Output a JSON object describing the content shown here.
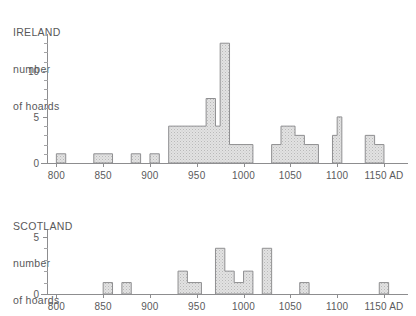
{
  "chart_data": [
    {
      "type": "bar",
      "id": "ireland",
      "title": "IRELAND\nnumber\nof hoards",
      "title_lines": [
        "IRELAND",
        "number",
        "of hoards"
      ],
      "xlabel": "",
      "ylabel": "number of hoards",
      "xlim": [
        790,
        1165
      ],
      "ylim": [
        0,
        14
      ],
      "xticks": [
        800,
        850,
        900,
        950,
        1000,
        1050,
        1100,
        1150
      ],
      "xticklabels": [
        "800",
        "850",
        "900",
        "950",
        "1000",
        "1050",
        "1100",
        "1150 AD"
      ],
      "yticks": [
        0,
        5,
        10
      ],
      "yticklabels": [
        "0",
        "5",
        "10"
      ],
      "yminorticks": [
        1,
        2,
        3,
        4,
        6,
        7,
        8,
        9,
        11,
        12,
        13
      ],
      "grid": false,
      "legend": false,
      "bin_width": 10,
      "bins": [
        {
          "start": 800,
          "end": 810,
          "value": 1
        },
        {
          "start": 840,
          "end": 860,
          "value": 1
        },
        {
          "start": 880,
          "end": 890,
          "value": 1
        },
        {
          "start": 900,
          "end": 910,
          "value": 1
        },
        {
          "start": 920,
          "end": 960,
          "value": 4
        },
        {
          "start": 960,
          "end": 970,
          "value": 7
        },
        {
          "start": 970,
          "end": 975,
          "value": 4
        },
        {
          "start": 975,
          "end": 985,
          "value": 13
        },
        {
          "start": 985,
          "end": 1010,
          "value": 2
        },
        {
          "start": 1030,
          "end": 1040,
          "value": 2
        },
        {
          "start": 1040,
          "end": 1055,
          "value": 4
        },
        {
          "start": 1055,
          "end": 1065,
          "value": 3
        },
        {
          "start": 1065,
          "end": 1080,
          "value": 2
        },
        {
          "start": 1095,
          "end": 1100,
          "value": 3
        },
        {
          "start": 1100,
          "end": 1105,
          "value": 5
        },
        {
          "start": 1130,
          "end": 1140,
          "value": 3
        },
        {
          "start": 1140,
          "end": 1150,
          "value": 2
        }
      ]
    },
    {
      "type": "bar",
      "id": "scotland",
      "title": "SCOTLAND\nnumber\nof hoards",
      "title_lines": [
        "SCOTLAND",
        "number",
        "of hoards"
      ],
      "xlabel": "",
      "ylabel": "number of hoards",
      "xlim": [
        790,
        1165
      ],
      "ylim": [
        0,
        5.6
      ],
      "xticks": [
        800,
        850,
        900,
        950,
        1000,
        1050,
        1100,
        1150
      ],
      "xticklabels": [
        "800",
        "850",
        "900",
        "950",
        "1000",
        "1050",
        "1100",
        "1150 AD"
      ],
      "yticks": [
        0,
        5
      ],
      "yticklabels": [
        "0",
        "5"
      ],
      "yminorticks": [
        1,
        2,
        3,
        4
      ],
      "grid": false,
      "legend": false,
      "bin_width": 10,
      "bins": [
        {
          "start": 850,
          "end": 860,
          "value": 1
        },
        {
          "start": 870,
          "end": 880,
          "value": 1
        },
        {
          "start": 930,
          "end": 940,
          "value": 2
        },
        {
          "start": 940,
          "end": 955,
          "value": 1
        },
        {
          "start": 970,
          "end": 980,
          "value": 4
        },
        {
          "start": 980,
          "end": 990,
          "value": 2
        },
        {
          "start": 990,
          "end": 1000,
          "value": 1
        },
        {
          "start": 1000,
          "end": 1010,
          "value": 2
        },
        {
          "start": 1020,
          "end": 1030,
          "value": 4
        },
        {
          "start": 1060,
          "end": 1070,
          "value": 1
        },
        {
          "start": 1145,
          "end": 1155,
          "value": 1
        }
      ]
    }
  ],
  "ireland": {
    "title_line1": "IRELAND",
    "title_line2": "number",
    "title_line3": "of hoards"
  },
  "scotland": {
    "title_line1": "SCOTLAND",
    "title_line2": "number",
    "title_line3": "of hoards"
  },
  "colors": {
    "bar_fill": "#d8d8d8",
    "bar_stroke": "#8f8f91",
    "axis": "#8d8d8f",
    "text": "#5a5a5c",
    "background": "#ffffff"
  }
}
